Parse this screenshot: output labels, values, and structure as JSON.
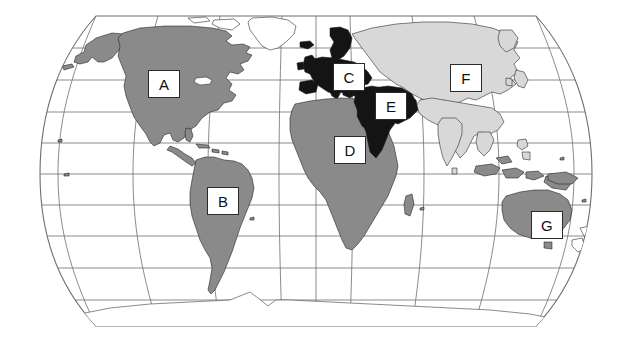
{
  "figure": {
    "type": "world-map",
    "projection": "Robinson",
    "background_color": "#ffffff",
    "caption": ""
  },
  "legend_colors": {
    "shade_medium_gray": "#8a8a8a",
    "shade_light_gray": "#d8d8d8",
    "shade_black": "#141414",
    "shade_white": "#ffffff",
    "graticule": "#6f6f6f",
    "coastline": "#1a1a1a"
  },
  "map": {
    "graticule": {
      "visible": true,
      "parallels_count": 9,
      "meridians_count": 9
    },
    "regions": [
      {
        "id": "A",
        "label": "A",
        "area": "north-america",
        "shade": "#8a8a8a",
        "x": 148,
        "y": 70
      },
      {
        "id": "B",
        "label": "B",
        "area": "south-america",
        "shade": "#8a8a8a",
        "x": 207,
        "y": 187
      },
      {
        "id": "C",
        "label": "C",
        "area": "europe",
        "shade": "#141414",
        "x": 333,
        "y": 63
      },
      {
        "id": "D",
        "label": "D",
        "area": "africa",
        "shade": "#8a8a8a",
        "x": 334,
        "y": 136
      },
      {
        "id": "E",
        "label": "E",
        "area": "middle-east",
        "shade": "#141414",
        "x": 375,
        "y": 92
      },
      {
        "id": "F",
        "label": "F",
        "area": "northern-asia",
        "shade": "#d8d8d8",
        "x": 450,
        "y": 64
      },
      {
        "id": "G",
        "label": "G",
        "area": "australia",
        "shade": "#8a8a8a",
        "x": 531,
        "y": 211
      }
    ],
    "unlabeled_areas": [
      {
        "area": "greenland",
        "shade": "#ffffff"
      },
      {
        "area": "antarctica",
        "shade": "#ffffff"
      },
      {
        "area": "southeast-asia-islands",
        "shade": "#8a8a8a"
      },
      {
        "area": "india",
        "shade": "#d8d8d8"
      },
      {
        "area": "china",
        "shade": "#d8d8d8"
      }
    ]
  }
}
